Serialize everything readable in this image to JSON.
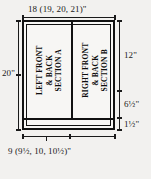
{
  "diagram": {
    "type": "garment-schematic",
    "background_color": "#f2f1ef",
    "line_color": "#111111",
    "panels": [
      {
        "id": "section-a",
        "position": "left",
        "lines": [
          "LEFT FRONT",
          "& BACK",
          "SECTION A"
        ]
      },
      {
        "id": "section-b",
        "position": "right",
        "lines": [
          "RIGHT FRONT",
          "& BACK",
          "SECTION B"
        ]
      }
    ],
    "dimensions": {
      "top_width": "18 (19, 20, 21)\"",
      "bottom_width": "9 (9½, 10, 10½)\"",
      "left_height": "20\"",
      "right_upper": "12\"",
      "right_middle": "6½\"",
      "right_lower": "1½\""
    }
  }
}
